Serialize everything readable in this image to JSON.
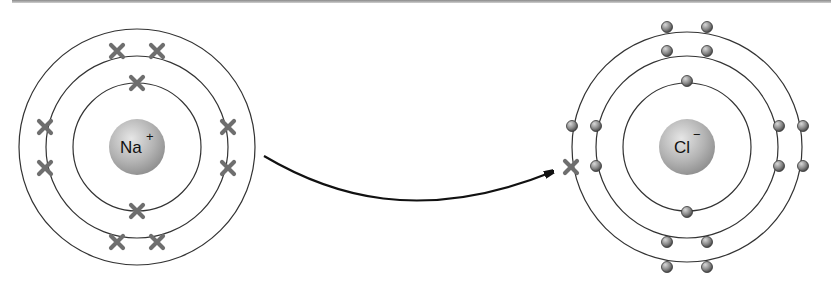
{
  "diagram": {
    "type": "ionic-bond-electron-transfer",
    "atoms": [
      {
        "id": "sodium",
        "symbol": "Na",
        "charge": "+",
        "center": [
          137,
          147
        ],
        "shells": [
          {
            "radius": 64,
            "electrons": 2,
            "marker": "cross"
          },
          {
            "radius": 91,
            "electrons": 8,
            "marker": "cross"
          },
          {
            "radius": 118,
            "electrons": 0,
            "marker": "cross"
          }
        ]
      },
      {
        "id": "chlorine",
        "symbol": "Cl",
        "charge": "−",
        "center": [
          687,
          147
        ],
        "shells": [
          {
            "radius": 64,
            "electrons": 2,
            "marker": "dot"
          },
          {
            "radius": 91,
            "electrons": 8,
            "marker": "dot"
          },
          {
            "radius": 115,
            "electrons": 8,
            "marker": "dot",
            "transferred_electron": "cross"
          }
        ]
      }
    ],
    "arrow": {
      "from": "sodium",
      "to": "chlorine",
      "meaning": "electron transfer"
    },
    "colors": {
      "orbit": "#333333",
      "cross_electron": "#6e6e6e",
      "dot_electron": "#7a7a7a",
      "nucleus": "#b5b5b5",
      "arrow": "#111111"
    }
  }
}
